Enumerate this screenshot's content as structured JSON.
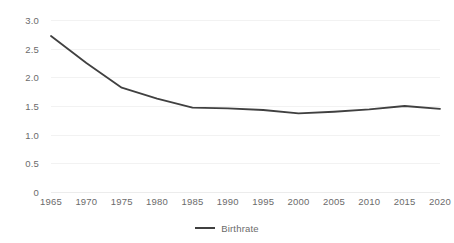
{
  "chart_data": {
    "type": "line",
    "title": "",
    "subtitle": "",
    "xlabel": "",
    "ylabel": "",
    "x": [
      1965,
      1970,
      1975,
      1980,
      1985,
      1990,
      1995,
      2000,
      2005,
      2010,
      2015,
      2020
    ],
    "series": [
      {
        "name": "Birthrate",
        "color": "#404040",
        "values": [
          2.72,
          2.25,
          1.82,
          1.63,
          1.47,
          1.46,
          1.43,
          1.37,
          1.4,
          1.44,
          1.5,
          1.45
        ]
      }
    ],
    "xlim": [
      1965,
      2020
    ],
    "ylim": [
      0,
      3.0
    ],
    "y_ticks": [
      0,
      0.5,
      1.0,
      1.5,
      2.0,
      2.5,
      3.0
    ],
    "y_tick_labels": [
      "0",
      "0.5",
      "1.0",
      "1.5",
      "2.0",
      "2.5",
      "3.0"
    ],
    "x_ticks": [
      1965,
      1970,
      1975,
      1980,
      1985,
      1990,
      1995,
      2000,
      2005,
      2010,
      2015,
      2020
    ],
    "x_tick_labels": [
      "1965",
      "1970",
      "1975",
      "1980",
      "1985",
      "1990",
      "1995",
      "2000",
      "2005",
      "2010",
      "2015",
      "2020"
    ],
    "grid": "horizontal",
    "legend_position": "bottom",
    "background_color": "#ffffff",
    "gridline_color": "#f2f2f2",
    "tick_label_color": "#6b6b6b"
  },
  "legend": {
    "entries": [
      {
        "label": "Birthrate",
        "color": "#404040"
      }
    ]
  }
}
